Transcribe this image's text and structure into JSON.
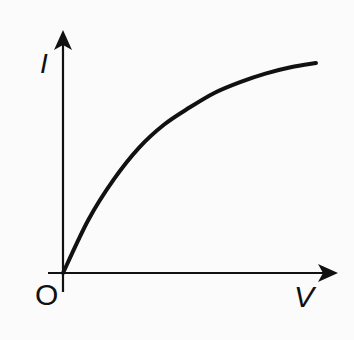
{
  "chart_data": {
    "type": "line",
    "title": "",
    "xlabel": "V",
    "ylabel": "I",
    "origin_label": "O",
    "grid": false,
    "legend": null,
    "series": [
      {
        "name": "I-V characteristic (concave, saturating)",
        "x": [
          0,
          0.1,
          0.2,
          0.3,
          0.4,
          0.5,
          0.6,
          0.7,
          0.8,
          0.9,
          1.0
        ],
        "y": [
          0,
          0.25,
          0.44,
          0.59,
          0.7,
          0.78,
          0.85,
          0.9,
          0.94,
          0.97,
          0.99
        ]
      }
    ],
    "xlim": [
      0,
      1.08
    ],
    "ylim": [
      0,
      1.2
    ]
  },
  "labels": {
    "y_axis": "I",
    "x_axis": "V",
    "origin": "O"
  }
}
